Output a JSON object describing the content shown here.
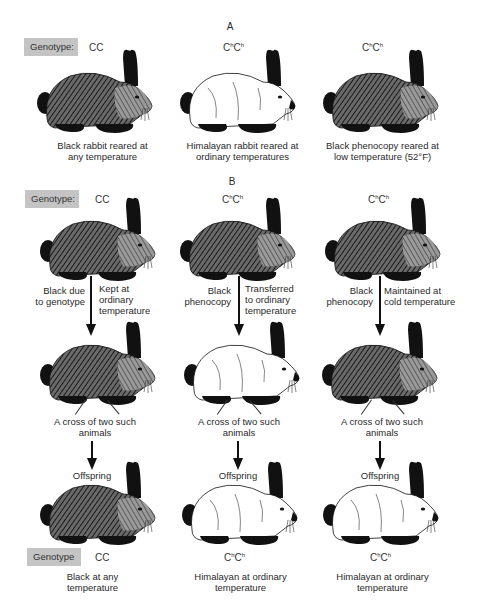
{
  "figure": {
    "section_a": {
      "letter": "A",
      "genotype_label": "Genotype:",
      "columns": [
        {
          "genotype": "CC",
          "coat": "dark",
          "caption_line1": "Black rabbit reared at",
          "caption_line2": "any temperature"
        },
        {
          "genotype": "ChCh",
          "coat": "white",
          "caption_line1": "Himalayan rabbit reared at",
          "caption_line2": "ordinary temperatures"
        },
        {
          "genotype": "ChCh",
          "coat": "dark",
          "caption_line1": "Black phenocopy reared at",
          "caption_line2": "low temperature (52°F)"
        }
      ]
    },
    "section_b": {
      "letter": "B",
      "genotype_label": "Genotype:",
      "columns": [
        {
          "genotype": "CC",
          "parent_coat": "dark",
          "left_note_line1": "Black due",
          "left_note_line2": "to genotype",
          "right_note_line1": "Kept at",
          "right_note_line2": "ordinary",
          "right_note_line3": "temperature",
          "adult_coat": "dark",
          "cross_line1": "A cross of two such",
          "cross_line2": "animals",
          "offspring_label": "Offspring",
          "offspring_coat": "dark",
          "final_genotype": "CC",
          "final_caption_line1": "Black at any",
          "final_caption_line2": "temperature"
        },
        {
          "genotype": "ChCh",
          "parent_coat": "dark",
          "left_note_line1": "Black",
          "left_note_line2": "phenocopy",
          "right_note_line1": "Transferred",
          "right_note_line2": "to ordinary",
          "right_note_line3": "temperature",
          "adult_coat": "white",
          "cross_line1": "A cross of two such",
          "cross_line2": "animals",
          "offspring_label": "Offspring",
          "offspring_coat": "white",
          "final_genotype": "ChCh",
          "final_caption_line1": "Himalayan at ordinary",
          "final_caption_line2": "temperature"
        },
        {
          "genotype": "ChCh",
          "parent_coat": "dark",
          "left_note_line1": "Black",
          "left_note_line2": "phenocopy",
          "right_note_line1": "Maintained at",
          "right_note_line2": "cold temperature",
          "right_note_line3": "",
          "adult_coat": "dark",
          "cross_line1": "A cross of two such",
          "cross_line2": "animals",
          "offspring_label": "Offspring",
          "offspring_coat": "white",
          "final_genotype": "ChCh",
          "final_caption_line1": "Himalayan at ordinary",
          "final_caption_line2": "temperature"
        }
      ],
      "bottom_genotype_label": "Genotype"
    },
    "colors": {
      "label_box": "#c4c4c4",
      "ink": "#111111",
      "dark_fur": "#4a4a4a",
      "white_fur": "#ffffff"
    }
  }
}
